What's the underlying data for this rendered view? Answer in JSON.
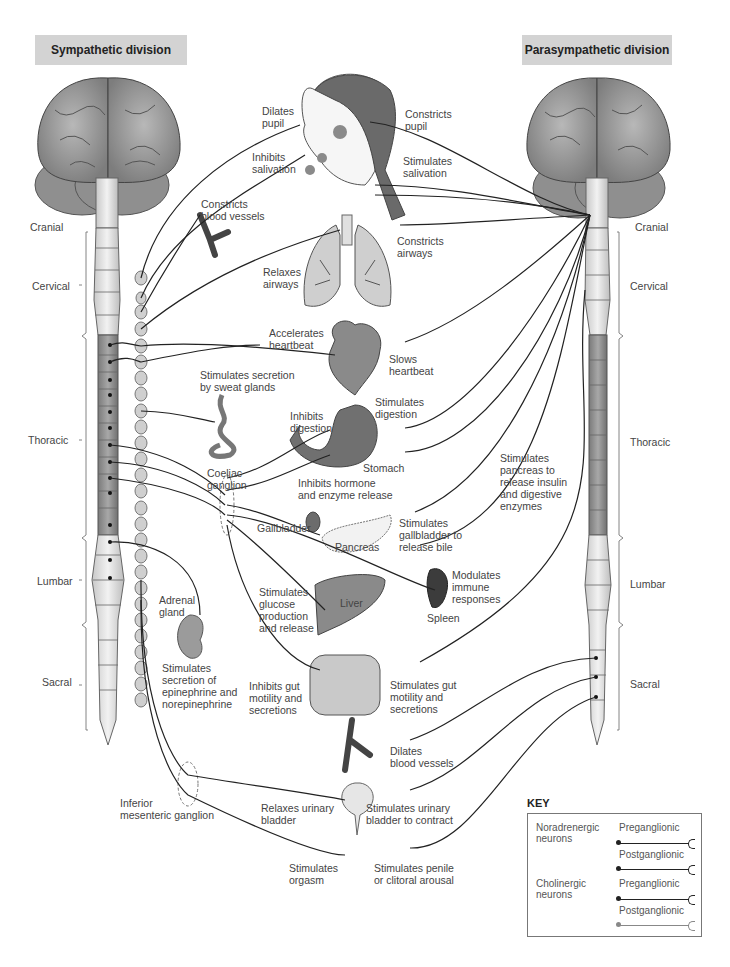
{
  "headers": {
    "sympathetic": "Sympathetic division",
    "parasympathetic": "Parasympathetic division"
  },
  "spinal_segments": {
    "left": [
      "Cranial",
      "Cervical",
      "Thoracic",
      "Lumbar",
      "Sacral"
    ],
    "right": [
      "Cranial",
      "Cervical",
      "Thoracic",
      "Lumbar",
      "Sacral"
    ]
  },
  "sympathetic_effects": {
    "dilates_pupil": "Dilates\npupil",
    "inhibits_salivation": "Inhibits\nsalivation",
    "constricts_blood_vessels": "Constricts\nblood vessels",
    "relaxes_airways": "Relaxes\nairways",
    "accelerates_heartbeat": "Accelerates\nheartbeat",
    "sweat_glands": "Stimulates secretion\nby sweat glands",
    "inhibits_digestion": "Inhibits\ndigestion",
    "coeliac_ganglion": "Coeliac\nganglion",
    "inhibits_hormone": "Inhibits hormone\nand enzyme release",
    "glucose": "Stimulates\nglucose\nproduction\nand release",
    "adrenal_gland": "Adrenal\ngland",
    "epinephrine": "Stimulates\nsecretion of\nepinephrine and\nnorepinephrine",
    "inhibits_gut": "Inhibits gut\nmotility and\nsecretions",
    "inferior_mesenteric": "Inferior\nmesenteric ganglion",
    "relaxes_bladder": "Relaxes urinary\nbladder",
    "stimulates_orgasm": "Stimulates\norgasm"
  },
  "parasympathetic_effects": {
    "constricts_pupil": "Constricts\npupil",
    "stimulates_salivation": "Stimulates\nsalivation",
    "constricts_airways": "Constricts\nairways",
    "slows_heartbeat": "Slows\nheartbeat",
    "stimulates_digestion": "Stimulates\ndigestion",
    "pancreas_insulin": "Stimulates\npancreas to\nrelease insulin\nand digestive\nenzymes",
    "gallbladder_bile": "Stimulates\ngallbladder to\nrelease bile",
    "modulates_immune": "Modulates\nimmune\nresponses",
    "stimulates_gut": "Stimulates gut\nmotility and\nsecretions",
    "dilates_blood_vessels": "Dilates\nblood vessels",
    "bladder_contract": "Stimulates urinary\nbladder to contract",
    "penile_arousal": "Stimulates penile\nor clitoral arousal"
  },
  "organs": {
    "stomach": "Stomach",
    "gallbladder": "Gallbladder",
    "pancreas": "Pancreas",
    "liver": "Liver",
    "spleen": "Spleen"
  },
  "key": {
    "title": "KEY",
    "groups": [
      {
        "name": "Noradrenergic\nneurons",
        "items": [
          "Preganglionic",
          "Postganglionic"
        ]
      },
      {
        "name": "Cholinergic\nneurons",
        "items": [
          "Preganglionic",
          "Postganglionic"
        ]
      }
    ]
  },
  "colors": {
    "header_bg": "#d3d3d3",
    "brain": "#9a9a9a",
    "cord_upper": "#e6e6e6",
    "cord_thoracic": "#8e8e8e",
    "ganglia": "#c8c8c8",
    "organ_dark": "#6e6e6e",
    "nerve": "#222222"
  }
}
